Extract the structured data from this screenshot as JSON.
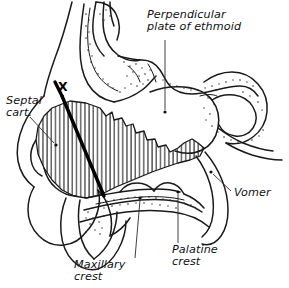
{
  "figure": {
    "background_color": "#ffffff",
    "ink_color": "#1a1a1a",
    "width": 289,
    "height": 288
  },
  "labels": {
    "ethmoid": {
      "line1": "Perpendicular",
      "line2": "plate of ethmoid",
      "x": 147,
      "y": 18,
      "leader_dot_x": 165,
      "leader_dot_y": 112
    },
    "septal_cartilage": {
      "line1": "Septal",
      "line2": "cart.",
      "x": 6,
      "y": 104,
      "leader_dot_x": 56,
      "leader_dot_y": 145
    },
    "vomer": {
      "line1": "Vomer",
      "x": 234,
      "y": 196,
      "leader_dot_x": 211,
      "leader_dot_y": 172
    },
    "maxillary_crest": {
      "line1": "Maxillary",
      "line2": "crest",
      "x": 74,
      "y": 268,
      "leader_dot_x": 140,
      "leader_dot_y": 198
    },
    "palatine_crest": {
      "line1": "Palatine",
      "line2": "crest",
      "x": 172,
      "y": 253,
      "leader_dot_x": 178,
      "leader_dot_y": 192
    }
  },
  "markers": {
    "incision_point": {
      "symbol": "X",
      "x": 58,
      "y": 91
    }
  },
  "regions": {
    "septal_cartilage_fill": "vertical-hatch",
    "bone_texture": "stipple"
  }
}
